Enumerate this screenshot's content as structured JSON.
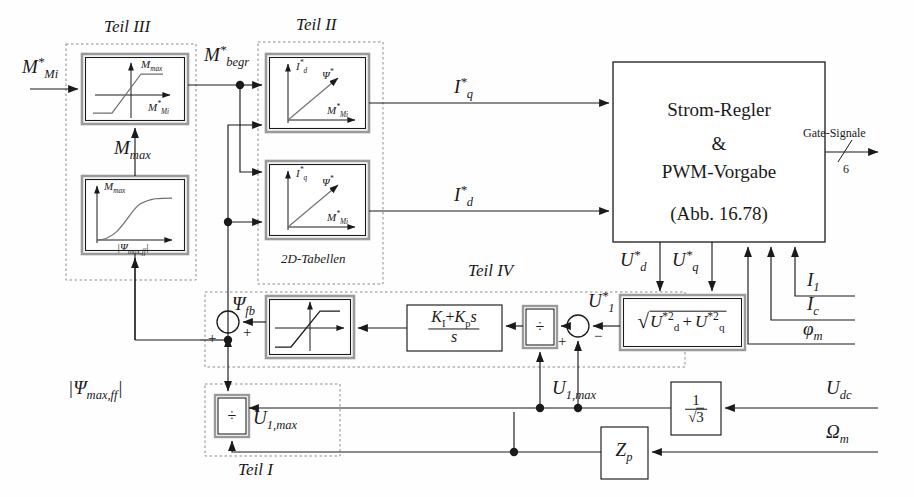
{
  "diagram": {
    "groups": {
      "teil1": "Teil I",
      "teil2": "Teil II",
      "teil3": "Teil III",
      "teil4": "Teil IV"
    },
    "signals": {
      "m_mi_ref": "M*_Mi",
      "m_begr_ref": "M*_begr",
      "m_max": "M_max",
      "psi_max_ff_abs": "|Psi_max,ff|",
      "psi_fb": "Psi_fb",
      "iq_ref": "I*_q",
      "id_ref": "I*_d",
      "ud_ref": "U*_d",
      "uq_ref": "U*_q",
      "u1_ref": "U*_1",
      "u1_max": "U_1,max",
      "u_dc": "U_dc",
      "omega_m": "Omega_m",
      "i_1": "I_1",
      "i_c": "I_c",
      "phi_m": "phi_m",
      "gate_signals": "Gate-Signale",
      "gate_count": "6"
    },
    "blocks": {
      "limiter_axis_y": "M_max",
      "limiter_axis_x": "M*_Mi",
      "mmax_curve_axis_y": "M_max",
      "mmax_curve_axis_x": "|Psi_max,ff|",
      "table_upper_axis_y": "I*_d",
      "table_upper_axis_x": "M*_Mi",
      "table_upper_curve": "Psi*",
      "table_lower_axis_y": "I*_q",
      "table_lower_axis_x": "M*_Mi",
      "table_lower_curve": "Psi*",
      "tables_caption": "2D-Tabellen",
      "current_controller_line1": "Strom-Regler",
      "current_controller_line2": "&",
      "current_controller_line3": "PWM-Vorgabe",
      "current_controller_line4": "(Abb. 16.78)",
      "pi_numerator": "K_I+K_p s",
      "pi_denominator": "s",
      "sqrt_expr": "sqrt( U*d^2 + U*q^2 )",
      "divide_symbol": "÷",
      "inv_sqrt3_num": "1",
      "inv_sqrt3_den": "sqrt(3)",
      "zp": "Z_p"
    },
    "signs": {
      "plus": "+",
      "minus": "−"
    },
    "colors": {
      "line": "#1a1a1a",
      "dashed_group": "#8a8a8a",
      "block_inner": "#9a9a9a",
      "curve": "#707070",
      "background": "#fefefe"
    }
  }
}
